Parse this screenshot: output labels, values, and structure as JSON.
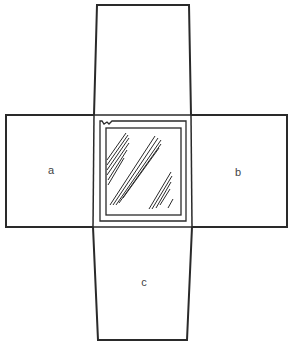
{
  "diagram": {
    "line_color": "#2a2a2a",
    "flaps": [
      {
        "id": "top",
        "label": ""
      },
      {
        "id": "a",
        "label": "a"
      },
      {
        "id": "b",
        "label": "b"
      },
      {
        "id": "c",
        "label": "c"
      }
    ],
    "center": {
      "feature": "window with glass hatching"
    }
  }
}
